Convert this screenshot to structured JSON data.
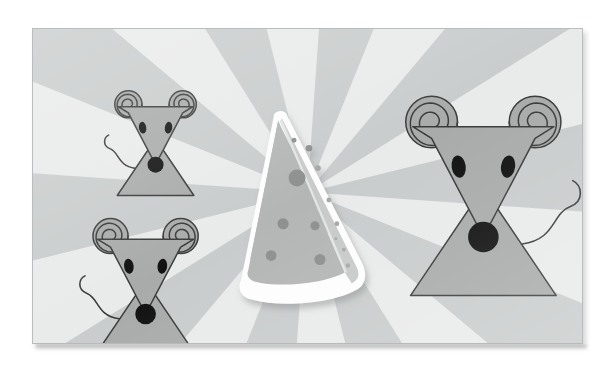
{
  "scene": {
    "title": "Three mice and a wedge of cheese",
    "medium": "flat vector illustration",
    "palette": {
      "background_light_ray": "#e9eaea",
      "background_dark_ray": "#c9cccc",
      "frame_border": "#b9bdc0",
      "mouse_body_fill": "#a9abab",
      "mouse_outline": "#3a3a3a",
      "mouse_eye": "#111111",
      "mouse_nose": "#111111",
      "cheese_outline_white": "#fdfdfd",
      "cheese_front_fill": "#b4b6b6",
      "cheese_side_fill": "#c8caca",
      "cheese_hole": "#8e9090",
      "drop_shadow": "#9a9c9c"
    },
    "background": {
      "type": "sunburst-rays",
      "center_x_pct": 50,
      "center_y_pct": 52,
      "ray_count": 20,
      "label": "radial alternating gray rays"
    }
  },
  "frame": {
    "x": 32,
    "y": 28,
    "width": 551,
    "height": 316,
    "has_drop_shadow": true
  },
  "cheese": {
    "label": "cheese-wedge",
    "center_x": 305,
    "center_y": 205,
    "holes_front": [
      {
        "cx": 238,
        "cy": 175,
        "r": 8.5
      },
      {
        "cx": 250,
        "cy": 222,
        "r": 5.5
      },
      {
        "cx": 230,
        "cy": 255,
        "r": 5.5
      },
      {
        "cx": 281,
        "cy": 226,
        "r": 4.5
      },
      {
        "cx": 281,
        "cy": 262,
        "r": 5.5
      },
      {
        "cx": 306,
        "cy": 152,
        "r": 3.2
      },
      {
        "cx": 286,
        "cy": 145,
        "r": 2.6
      }
    ],
    "holes_side": [
      {
        "cx": 331,
        "cy": 169,
        "r": 2.8
      },
      {
        "cx": 330,
        "cy": 196,
        "r": 2.4
      },
      {
        "cx": 336,
        "cy": 220,
        "r": 2.4
      },
      {
        "cx": 333,
        "cy": 232,
        "r": 1.5
      },
      {
        "cx": 343,
        "cy": 244,
        "r": 1.8
      },
      {
        "cx": 345,
        "cy": 262,
        "r": 2.2
      }
    ]
  },
  "mice": [
    {
      "id": "mouse-top-left",
      "label": "small mouse upper left",
      "cx": 123,
      "cy": 108,
      "scale": 0.62,
      "tail_side": "left"
    },
    {
      "id": "mouse-bottom-left",
      "label": "medium mouse lower left",
      "cx": 113,
      "cy": 250,
      "scale": 0.8,
      "tail_side": "left"
    },
    {
      "id": "mouse-right",
      "label": "large mouse right",
      "cx": 452,
      "cy": 155,
      "scale": 1.18,
      "tail_side": "right"
    }
  ]
}
